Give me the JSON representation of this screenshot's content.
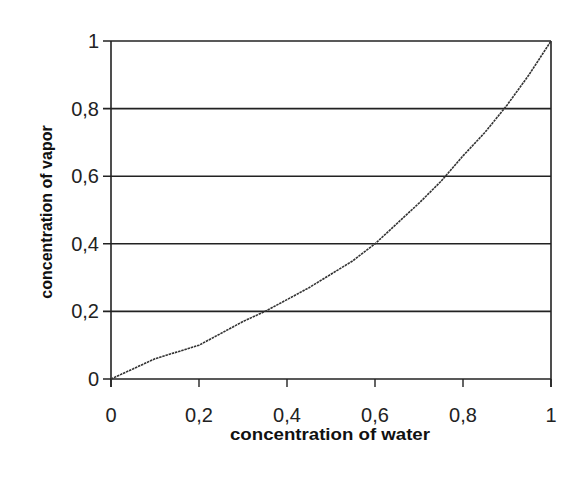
{
  "chart_data": {
    "type": "line",
    "title": "",
    "xlabel": "concentration of water",
    "ylabel": "concentration of vapor",
    "xlim": [
      0,
      1
    ],
    "ylim": [
      0,
      1
    ],
    "x_ticks": [
      "0",
      "0,2",
      "0,4",
      "0,6",
      "0,8",
      "1"
    ],
    "y_ticks": [
      "0",
      "0,2",
      "0,4",
      "0,6",
      "0,8",
      "1"
    ],
    "grid": "horizontal",
    "legend": null,
    "series": [
      {
        "name": "equilibrium curve",
        "x": [
          0,
          0.05,
          0.1,
          0.15,
          0.2,
          0.25,
          0.3,
          0.35,
          0.4,
          0.45,
          0.5,
          0.55,
          0.6,
          0.65,
          0.7,
          0.75,
          0.8,
          0.85,
          0.9,
          0.95,
          1.0
        ],
        "y": [
          0,
          0.03,
          0.06,
          0.08,
          0.1,
          0.135,
          0.17,
          0.2,
          0.235,
          0.27,
          0.31,
          0.35,
          0.4,
          0.46,
          0.52,
          0.585,
          0.66,
          0.73,
          0.81,
          0.9,
          1.0
        ]
      }
    ]
  },
  "labels": {
    "xlabel": "concentration of water",
    "ylabel": "concentration of vapor"
  }
}
